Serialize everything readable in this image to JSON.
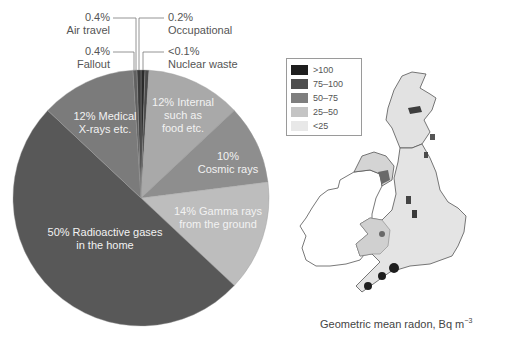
{
  "chart_data": [
    {
      "type": "pie",
      "title": "",
      "direction": "clockwise from 12 o'clock",
      "slices": [
        {
          "label": "Nuclear waste",
          "display": "<0.1%",
          "value": 0.1,
          "color": "#2a2a2a",
          "placement": "outside"
        },
        {
          "label": "Occupational",
          "display": "0.2%",
          "value": 0.2,
          "color": "#4a4a4a",
          "placement": "outside"
        },
        {
          "label": "Internal such as food etc.",
          "display": "12%",
          "value": 12,
          "color": "#a9a9a9",
          "placement": "inside"
        },
        {
          "label": "Cosmic rays",
          "display": "10%",
          "value": 10,
          "color": "#8e8e8e",
          "placement": "inside"
        },
        {
          "label": "Gamma rays from the ground",
          "display": "14%",
          "value": 14,
          "color": "#bdbdbd",
          "placement": "inside"
        },
        {
          "label": "Radioactive gases in the home",
          "display": "50%",
          "value": 50,
          "color": "#585858",
          "placement": "inside"
        },
        {
          "label": "Medical X-rays etc.",
          "display": "12%",
          "value": 12,
          "color": "#7b7b7b",
          "placement": "inside"
        },
        {
          "label": "Fallout",
          "display": "0.4%",
          "value": 0.4,
          "color": "#606060",
          "placement": "outside"
        },
        {
          "label": "Air travel",
          "display": "0.4%",
          "value": 0.4,
          "color": "#3a3a3a",
          "placement": "outside"
        }
      ]
    },
    {
      "type": "heatmap",
      "title": "Geometric mean radon, Bq m-3",
      "description": "Choropleth map of the UK and Ireland showing geometric mean indoor radon concentrations",
      "legend": [
        {
          "range": ">100",
          "color": "#1e1e1e"
        },
        {
          "range": "75–100",
          "color": "#4f4f4f"
        },
        {
          "range": "50–75",
          "color": "#7e7e7e"
        },
        {
          "range": "25–50",
          "color": "#c4c4c4"
        },
        {
          "range": "<25",
          "color": "#e8e8e8"
        }
      ],
      "high_regions": [
        "Cornwall",
        "Devon",
        "Northamptonshire",
        "Derbyshire",
        "Aberdeenshire",
        "Northern Ireland (south-east)"
      ]
    }
  ],
  "pie_labels": {
    "air_travel": {
      "pct": "0.4%",
      "name": "Air travel"
    },
    "fallout": {
      "pct": "0.4%",
      "name": "Fallout"
    },
    "occupational": {
      "pct": "0.2%",
      "name": "Occupational"
    },
    "nuclear_waste": {
      "pct": "<0.1%",
      "name": "Nuclear waste"
    },
    "internal": {
      "line1": "12% Internal",
      "line2": "such as",
      "line3": "food etc."
    },
    "cosmic": {
      "line1": "10%",
      "line2": "Cosmic rays"
    },
    "gamma": {
      "line1": "14% Gamma rays",
      "line2": "from the ground"
    },
    "radon": {
      "line1": "50% Radioactive gases",
      "line2": "in the home"
    },
    "medical": {
      "line1": "12% Medical",
      "line2": "X-rays etc."
    }
  },
  "map": {
    "legend": [
      {
        "label": ">100",
        "color": "#1e1e1e"
      },
      {
        "label": "75–100",
        "color": "#4f4f4f"
      },
      {
        "label": "50–75",
        "color": "#7e7e7e"
      },
      {
        "label": "25–50",
        "color": "#c4c4c4"
      },
      {
        "label": "<25",
        "color": "#e8e8e8"
      }
    ],
    "caption": "Geometric mean radon, Bq m",
    "caption_sup": "−3"
  }
}
